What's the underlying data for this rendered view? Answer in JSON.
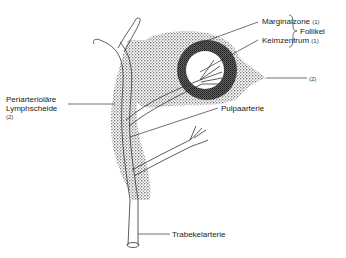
{
  "diagram": {
    "labels": {
      "marginalzone": "Marginalzone",
      "marginalzone_ref": "(1)",
      "keimzentrum": "Keimzentrum",
      "keimzentrum_ref": "(1)",
      "follikel": "Follikel",
      "red_pulp_ref": "(2)",
      "pals_line1": "Periarteriolare",
      "pals_line1_display": "Periarterioläre",
      "pals_line2": "Lymphscheide",
      "pals_ref": "(2)",
      "pulpaarterie": "Pulpaarterie",
      "trabekelarterie": "Trabekelarterie"
    },
    "colors": {
      "stipple": "#555555",
      "dark_stipple": "#2a2a2a",
      "line": "#333333",
      "background": "#ffffff"
    }
  }
}
